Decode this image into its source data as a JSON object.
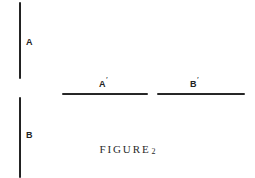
{
  "figure": {
    "caption_word": "FIGURE",
    "caption_number": "2",
    "background_color": "#ffffff",
    "ink_color": "#1b1b1b"
  },
  "labels": {
    "a": "A",
    "b": "B",
    "a_prime_base": "A",
    "a_prime_mark": "′",
    "b_prime_base": "B",
    "b_prime_mark": "′"
  },
  "diagram_data": {
    "type": "line-segment-diagram",
    "description": "Two vertical line segments labeled A and B at left; two horizontal line segments labeled A′ and B′ at right.",
    "segments": [
      {
        "id": "A",
        "label": "A",
        "orientation": "vertical",
        "x1": 19,
        "y1": 2,
        "x2": 19,
        "y2": 79,
        "length_px": 77,
        "thickness_px": 2,
        "label_position": "right-middle"
      },
      {
        "id": "B",
        "label": "B",
        "orientation": "vertical",
        "x1": 19,
        "y1": 97,
        "x2": 19,
        "y2": 178,
        "length_px": 81,
        "thickness_px": 2,
        "label_position": "right-middle"
      },
      {
        "id": "A-prime",
        "label": "A′",
        "orientation": "horizontal",
        "x1": 62,
        "y1": 93,
        "x2": 148,
        "y2": 93,
        "length_px": 86,
        "thickness_px": 2,
        "label_position": "above-center"
      },
      {
        "id": "B-prime",
        "label": "B′",
        "orientation": "horizontal",
        "x1": 157,
        "y1": 93,
        "x2": 245,
        "y2": 93,
        "length_px": 88,
        "thickness_px": 2,
        "label_position": "above-center"
      }
    ],
    "canvas": {
      "width": 255,
      "height": 178
    }
  }
}
